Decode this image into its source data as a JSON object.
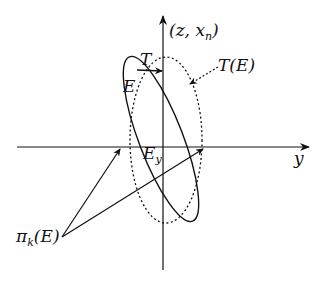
{
  "diagram": {
    "labels": {
      "vertical_axis": "(z, x",
      "vertical_axis_sub": "n",
      "vertical_axis_close": ")",
      "horizontal_axis": "y",
      "transform_arrow": "T",
      "transformed_set": "T(E)",
      "set": "E",
      "intersection": "E",
      "intersection_sub": "y",
      "projection": "π",
      "projection_sub": "k",
      "projection_arg": "(E)"
    },
    "colors": {
      "stroke": "#111111",
      "background": "#ffffff"
    }
  }
}
